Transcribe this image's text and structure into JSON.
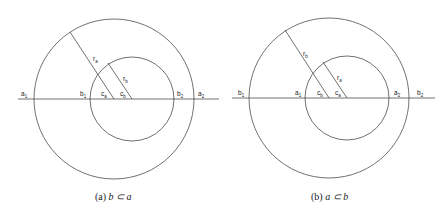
{
  "panels": [
    {
      "caption_prefix": "(a) ",
      "caption_math": "b ⊂ a",
      "labels": {
        "p1": "a₁",
        "p2": "b₁",
        "p3": "cₐ",
        "p4": "c_b",
        "p5": "b₂",
        "p6": "a₂",
        "r_outer": "rₐ",
        "r_inner": "r_b"
      }
    },
    {
      "caption_prefix": "(b) ",
      "caption_math": "a ⊂ b",
      "labels": {
        "p1": "b₁",
        "p2": "a₁",
        "p3": "c_b",
        "p4": "cₐ",
        "p5": "a₂",
        "p6": "b₂",
        "r_outer": "r_b",
        "r_inner": "rₐ"
      }
    }
  ],
  "display": {
    "a": {
      "a1": "a",
      "s1": "1",
      "b1": "b",
      "ca": "c",
      "sa": "a",
      "cb": "c",
      "sb": "b",
      "b2": "b",
      "s2": "2",
      "a2": "a",
      "ra": "r",
      "rb": "r"
    }
  },
  "captions": {
    "a_prefix": "(a) ",
    "a_math": "b ⊂ a",
    "b_prefix": "(b) ",
    "b_math": "a ⊂ b"
  },
  "text": {
    "a": {
      "a1": "a₁",
      "b1": "b₁",
      "ca": "cₐ",
      "cb": "c_b",
      "b2": "b₂",
      "a2": "a₂",
      "ra": "rₐ",
      "rb": "r_b"
    },
    "b": {
      "b1": "b₁",
      "a1": "a₁",
      "cb": "c_b",
      "ca": "cₐ",
      "a2": "a₂",
      "b2": "b₂",
      "rb": "r_b",
      "ra": "rₐ"
    }
  },
  "sub": {
    "one": "1",
    "two": "2",
    "a": "a",
    "b": "b"
  },
  "base": {
    "a": "a",
    "b": "b",
    "c": "c",
    "r": "r"
  },
  "colors": {
    "line": "#333333",
    "background": "#ffffff"
  }
}
